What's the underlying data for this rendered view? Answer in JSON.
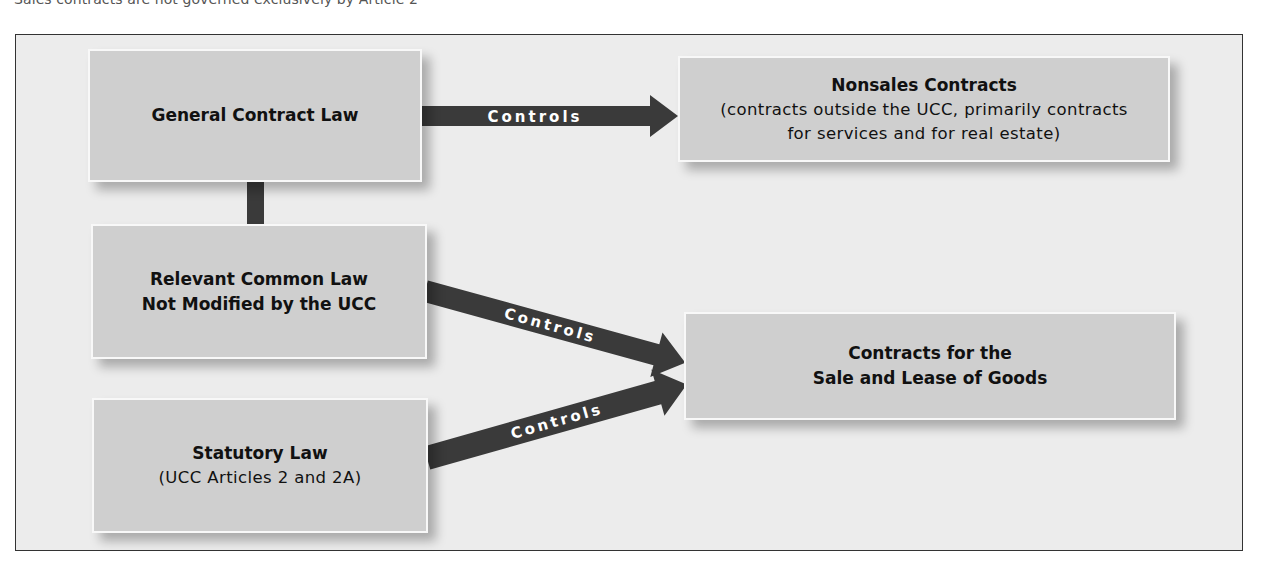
{
  "caption": "Sales contracts are not governed exclusively by Article 2",
  "diagram": {
    "sources": [
      {
        "id": "general",
        "title": "General Contract Law",
        "subtitle": ""
      },
      {
        "id": "common",
        "title_line1": "Relevant Common Law",
        "title_line2": "Not Modified by the UCC"
      },
      {
        "id": "statutory",
        "title": "Statutory Law",
        "subtitle": "(UCC Articles 2 and 2A)"
      }
    ],
    "targets": [
      {
        "id": "nonsales",
        "title": "Nonsales Contracts",
        "subtitle_line1": "(contracts outside the UCC, primarily contracts",
        "subtitle_line2": "for services and for real estate)"
      },
      {
        "id": "sales",
        "title_line1": "Contracts for the",
        "title_line2": "Sale and Lease of Goods"
      }
    ],
    "arrows": [
      {
        "from": "General Contract Law",
        "to": "Nonsales Contracts",
        "label": "Controls"
      },
      {
        "from": "Relevant Common Law Not Modified by the UCC",
        "to": "Contracts for the Sale and Lease of Goods",
        "label": "Controls"
      },
      {
        "from": "Statutory Law (UCC Articles 2 and 2A)",
        "to": "Contracts for the Sale and Lease of Goods",
        "label": "Controls"
      }
    ],
    "colors": {
      "box_fill": "#cfcfcf",
      "box_border": "#f8f8f8",
      "arrow": "#3a3a3a",
      "frame_bg": "#ececec",
      "arrow_text": "#ffffff"
    }
  }
}
